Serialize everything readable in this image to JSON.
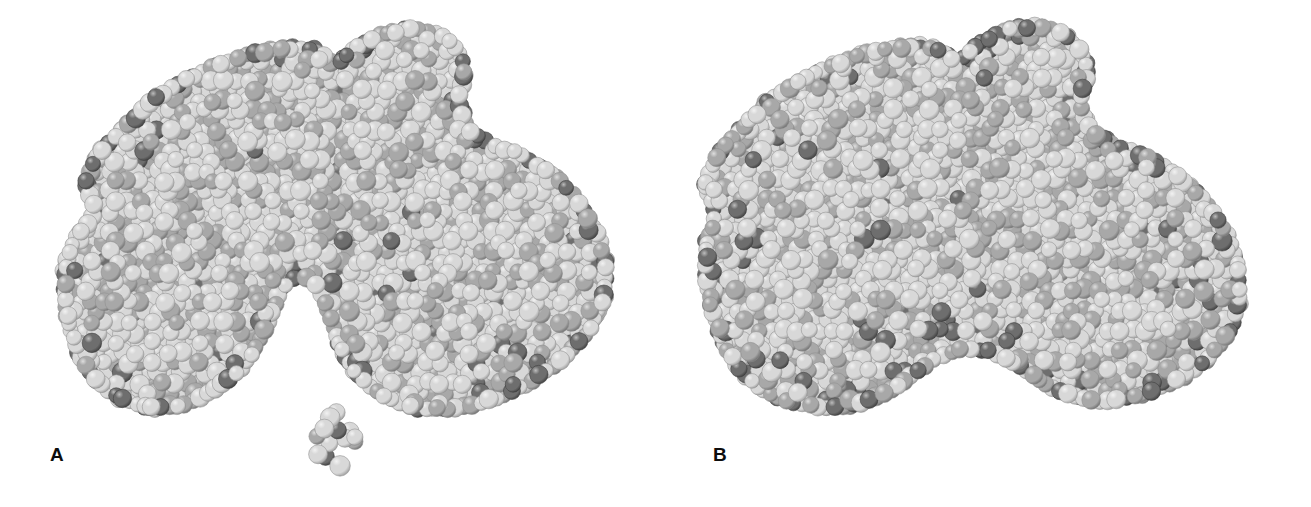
{
  "figure": {
    "background_color": "#ffffff",
    "width": 1311,
    "height": 507,
    "rendering_style": "space-filling CPK model, grayscale halftone"
  },
  "panels": [
    {
      "label": "A",
      "label_x": 50,
      "label_y": 445,
      "conformation": "open",
      "description": "Open conformation with deep cleft between lobes and unbound ligand below",
      "has_cleft": true,
      "has_free_ligand": true
    },
    {
      "label": "B",
      "label_x": 713,
      "label_y": 445,
      "conformation": "closed",
      "description": "Closed conformation, cleft collapsed, ligand engulfed",
      "has_cleft": false,
      "has_free_ligand": false
    }
  ],
  "colors": {
    "sphere_light": "#d8d8d8",
    "sphere_light_shadow": "#9a9a9a",
    "sphere_light_highlight": "#f2f2f2",
    "sphere_dark": "#6e6e6e",
    "sphere_dark_shadow": "#3e3e3e",
    "sphere_dark_highlight": "#bdbdbd",
    "sphere_mid": "#a8a8a8",
    "sphere_mid_shadow": "#6c6c6c",
    "sphere_mid_highlight": "#dedede",
    "label_color": "#0d0d0d",
    "background": "#ffffff"
  },
  "chart_data": {
    "type": "scatter",
    "title": "Space-filling models of a protein in open (A) and closed (B) conformations",
    "xlabel": "",
    "ylabel": "",
    "legend": [
      {
        "name": "light atom",
        "color": "#d8d8d8"
      },
      {
        "name": "dark atom",
        "color": "#6e6e6e"
      },
      {
        "name": "mid atom",
        "color": "#a8a8a8"
      }
    ],
    "grid": false,
    "panel_a": {
      "label": "A",
      "outline": [
        [
          92,
          210
        ],
        [
          80,
          182
        ],
        [
          96,
          150
        ],
        [
          128,
          118
        ],
        [
          150,
          96
        ],
        [
          180,
          78
        ],
        [
          214,
          62
        ],
        [
          250,
          50
        ],
        [
          286,
          44
        ],
        [
          316,
          46
        ],
        [
          336,
          60
        ],
        [
          352,
          44
        ],
        [
          382,
          30
        ],
        [
          414,
          24
        ],
        [
          442,
          30
        ],
        [
          462,
          48
        ],
        [
          470,
          74
        ],
        [
          462,
          100
        ],
        [
          470,
          126
        ],
        [
          492,
          140
        ],
        [
          520,
          150
        ],
        [
          552,
          168
        ],
        [
          580,
          196
        ],
        [
          600,
          228
        ],
        [
          610,
          264
        ],
        [
          608,
          300
        ],
        [
          592,
          334
        ],
        [
          566,
          362
        ],
        [
          532,
          386
        ],
        [
          494,
          404
        ],
        [
          452,
          414
        ],
        [
          412,
          412
        ],
        [
          378,
          398
        ],
        [
          352,
          376
        ],
        [
          336,
          348
        ],
        [
          326,
          316
        ],
        [
          316,
          292
        ],
        [
          300,
          278
        ],
        [
          284,
          292
        ],
        [
          274,
          318
        ],
        [
          262,
          346
        ],
        [
          242,
          374
        ],
        [
          214,
          396
        ],
        [
          182,
          410
        ],
        [
          148,
          412
        ],
        [
          118,
          402
        ],
        [
          94,
          384
        ],
        [
          76,
          358
        ],
        [
          66,
          328
        ],
        [
          60,
          296
        ],
        [
          62,
          262
        ],
        [
          74,
          232
        ]
      ],
      "cleft": {
        "present": true,
        "apex_x": 300,
        "apex_y": 276,
        "mouth_left_x": 262,
        "mouth_right_x": 340,
        "mouth_y": 404,
        "depth_px": 128
      },
      "free_ligand": {
        "present": true,
        "center_x": 336,
        "center_y": 445,
        "radius_x": 22,
        "radius_y": 34,
        "atom_count": 14
      },
      "atom_count_estimate": 1150
    },
    "panel_b": {
      "label": "B",
      "outline": [
        [
          712,
          214
        ],
        [
          700,
          184
        ],
        [
          714,
          152
        ],
        [
          744,
          120
        ],
        [
          768,
          96
        ],
        [
          800,
          76
        ],
        [
          834,
          60
        ],
        [
          870,
          48
        ],
        [
          906,
          42
        ],
        [
          936,
          44
        ],
        [
          958,
          58
        ],
        [
          976,
          40
        ],
        [
          1006,
          26
        ],
        [
          1038,
          22
        ],
        [
          1066,
          30
        ],
        [
          1086,
          50
        ],
        [
          1092,
          76
        ],
        [
          1084,
          102
        ],
        [
          1094,
          128
        ],
        [
          1118,
          142
        ],
        [
          1146,
          152
        ],
        [
          1178,
          170
        ],
        [
          1208,
          198
        ],
        [
          1230,
          230
        ],
        [
          1242,
          266
        ],
        [
          1244,
          302
        ],
        [
          1232,
          336
        ],
        [
          1208,
          364
        ],
        [
          1176,
          386
        ],
        [
          1140,
          400
        ],
        [
          1104,
          406
        ],
        [
          1070,
          400
        ],
        [
          1040,
          386
        ],
        [
          1014,
          368
        ],
        [
          992,
          356
        ],
        [
          966,
          352
        ],
        [
          940,
          360
        ],
        [
          916,
          378
        ],
        [
          890,
          396
        ],
        [
          858,
          408
        ],
        [
          822,
          412
        ],
        [
          788,
          406
        ],
        [
          758,
          392
        ],
        [
          734,
          370
        ],
        [
          718,
          342
        ],
        [
          708,
          310
        ],
        [
          702,
          278
        ],
        [
          702,
          246
        ]
      ],
      "cleft": {
        "present": false,
        "apex_x": 966,
        "apex_y": 352,
        "mouth_left_x": 940,
        "mouth_right_x": 996,
        "mouth_y": 398,
        "depth_px": 46
      },
      "free_ligand": {
        "present": false
      },
      "atom_count_estimate": 1180
    }
  }
}
